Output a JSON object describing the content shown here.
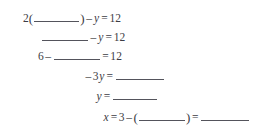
{
  "document": {
    "kind": "math-worksheet-fill-in-the-blank",
    "text_color": "#3c3c44",
    "blank_rule_color": "#54545c",
    "background_color": "#ffffff",
    "lines": [
      {
        "id": "line-1",
        "plain_text": "2(______) - y = 12",
        "tokens": {
          "coefficient": "2",
          "open_paren": "(",
          "close_paren": ")",
          "minus": "–",
          "variable": "y",
          "equals": "=",
          "right_side": "12"
        }
      },
      {
        "id": "line-2",
        "plain_text": "______ - y = 12",
        "tokens": {
          "minus": "–",
          "variable": "y",
          "equals": "=",
          "right_side": "12"
        }
      },
      {
        "id": "line-3",
        "plain_text": "6 - ______ = 12",
        "tokens": {
          "left_number": "6",
          "minus": "–",
          "equals": "=",
          "right_side": "12"
        }
      },
      {
        "id": "line-4",
        "plain_text": "-3y = ______",
        "tokens": {
          "minus": "–",
          "coefficient": "3",
          "variable": "y",
          "equals": "="
        }
      },
      {
        "id": "line-5",
        "plain_text": "y = ______",
        "tokens": {
          "variable": "y",
          "equals": "="
        }
      },
      {
        "id": "line-6",
        "plain_text": "x = 3 - (______) = ______",
        "tokens": {
          "variable": "x",
          "equals_1": "=",
          "left_number": "3",
          "minus": "–",
          "open_paren": "(",
          "close_paren": ")",
          "equals_2": "="
        }
      }
    ]
  }
}
